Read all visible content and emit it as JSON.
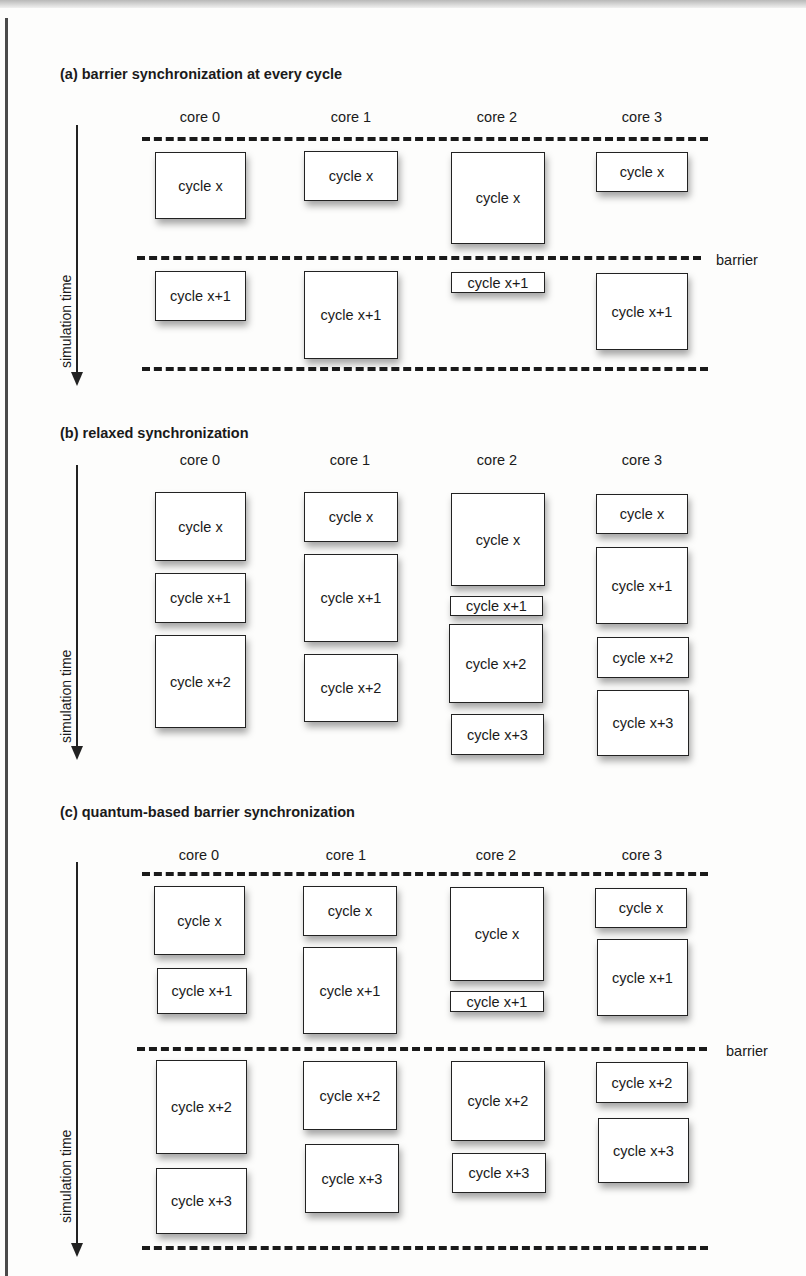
{
  "sections": [
    {
      "id": "a",
      "title": "(a) barrier synchronization at every cycle",
      "cores": [
        "core 0",
        "core 1",
        "core 2",
        "core 3"
      ],
      "axis_label": "simulation time",
      "barrier_label": "barrier",
      "boxes": [
        {
          "core": 0,
          "label": "cycle x"
        },
        {
          "core": 1,
          "label": "cycle x"
        },
        {
          "core": 2,
          "label": "cycle x"
        },
        {
          "core": 3,
          "label": "cycle x"
        },
        {
          "core": 0,
          "label": "cycle x+1"
        },
        {
          "core": 1,
          "label": "cycle x+1"
        },
        {
          "core": 2,
          "label": "cycle x+1"
        },
        {
          "core": 3,
          "label": "cycle x+1"
        }
      ]
    },
    {
      "id": "b",
      "title": "(b) relaxed synchronization",
      "cores": [
        "core 0",
        "core 1",
        "core 2",
        "core 3"
      ],
      "axis_label": "simulation time",
      "boxes": [
        {
          "core": 0,
          "label": "cycle x"
        },
        {
          "core": 0,
          "label": "cycle x+1"
        },
        {
          "core": 0,
          "label": "cycle x+2"
        },
        {
          "core": 1,
          "label": "cycle x"
        },
        {
          "core": 1,
          "label": "cycle x+1"
        },
        {
          "core": 1,
          "label": "cycle x+2"
        },
        {
          "core": 2,
          "label": "cycle x"
        },
        {
          "core": 2,
          "label": "cycle x+1"
        },
        {
          "core": 2,
          "label": "cycle x+2"
        },
        {
          "core": 2,
          "label": "cycle x+3"
        },
        {
          "core": 3,
          "label": "cycle x"
        },
        {
          "core": 3,
          "label": "cycle x+1"
        },
        {
          "core": 3,
          "label": "cycle x+2"
        },
        {
          "core": 3,
          "label": "cycle x+3"
        }
      ]
    },
    {
      "id": "c",
      "title": "(c) quantum-based barrier synchronization",
      "cores": [
        "core 0",
        "core 1",
        "core 2",
        "core 3"
      ],
      "axis_label": "simulation time",
      "barrier_label": "barrier",
      "boxes": [
        {
          "core": 0,
          "label": "cycle x"
        },
        {
          "core": 0,
          "label": "cycle x+1"
        },
        {
          "core": 1,
          "label": "cycle x"
        },
        {
          "core": 1,
          "label": "cycle x+1"
        },
        {
          "core": 2,
          "label": "cycle x"
        },
        {
          "core": 2,
          "label": "cycle x+1"
        },
        {
          "core": 3,
          "label": "cycle x"
        },
        {
          "core": 3,
          "label": "cycle x+1"
        },
        {
          "core": 0,
          "label": "cycle x+2"
        },
        {
          "core": 0,
          "label": "cycle x+3"
        },
        {
          "core": 1,
          "label": "cycle x+2"
        },
        {
          "core": 1,
          "label": "cycle x+3"
        },
        {
          "core": 2,
          "label": "cycle x+2"
        },
        {
          "core": 2,
          "label": "cycle x+3"
        },
        {
          "core": 3,
          "label": "cycle x+2"
        },
        {
          "core": 3,
          "label": "cycle x+3"
        }
      ]
    }
  ]
}
